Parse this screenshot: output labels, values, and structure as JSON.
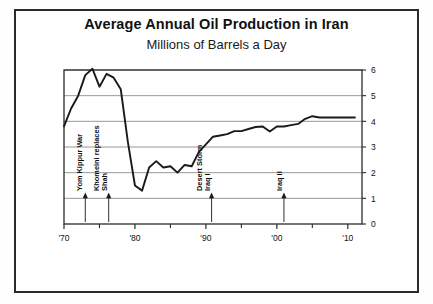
{
  "figure": {
    "title": "Average Annual Oil Production in Iran",
    "subtitle": "Millions of Barrels a Day"
  },
  "chart_data": {
    "type": "line",
    "title": "Average Annual Oil Production in Iran",
    "subtitle": "Millions of Barrels a Day",
    "xlabel": "",
    "ylabel": "Millions of Barrels a Day",
    "xlim": [
      1970,
      2012
    ],
    "ylim": [
      0,
      6
    ],
    "grid": true,
    "legend": "none",
    "ytick_labels": [
      "0",
      "1",
      "2",
      "3",
      "4",
      "5",
      "6"
    ],
    "ytick_values": [
      0,
      1,
      2,
      3,
      4,
      5,
      6
    ],
    "xtick_labels": [
      "'70",
      "'80",
      "'90",
      "'00",
      "'10"
    ],
    "xtick_values": [
      1970,
      1980,
      1990,
      2000,
      2010
    ],
    "minor_xticks": [
      1975,
      1985,
      1995,
      2005
    ],
    "series": [
      {
        "name": "Oil production",
        "color": "#1a1a1a",
        "x": [
          1970,
          1971,
          1972,
          1973,
          1974,
          1975,
          1976,
          1977,
          1978,
          1979,
          1980,
          1981,
          1982,
          1983,
          1984,
          1985,
          1986,
          1987,
          1988,
          1989,
          1990,
          1991,
          1992,
          1993,
          1994,
          1995,
          1996,
          1997,
          1998,
          1999,
          2000,
          2001,
          2002,
          2003,
          2004,
          2005,
          2006,
          2007,
          2008,
          2009,
          2010,
          2011
        ],
        "values": [
          3.8,
          4.5,
          5.0,
          5.8,
          6.05,
          5.35,
          5.85,
          5.7,
          5.25,
          3.2,
          1.5,
          1.3,
          2.2,
          2.45,
          2.2,
          2.25,
          2.0,
          2.3,
          2.25,
          2.8,
          3.1,
          3.4,
          3.45,
          3.5,
          3.62,
          3.62,
          3.7,
          3.78,
          3.8,
          3.6,
          3.8,
          3.8,
          3.85,
          3.9,
          4.1,
          4.2,
          4.15,
          4.15,
          4.15,
          4.15,
          4.15,
          4.15
        ]
      }
    ],
    "annotations": [
      {
        "label": "Yom Kippur War",
        "x": 1973,
        "rotation": -90
      },
      {
        "label": "Khomeini replaces",
        "x": 1979,
        "rotation": -90
      },
      {
        "label": "Shah",
        "x": 1979,
        "rotation": -90
      },
      {
        "label": "Desert Storm",
        "x": 1991,
        "rotation": -90
      },
      {
        "label": "Iraq I",
        "x": 1991,
        "rotation": -90
      },
      {
        "label": "Iraq II",
        "x": 2003,
        "rotation": -90
      }
    ]
  }
}
